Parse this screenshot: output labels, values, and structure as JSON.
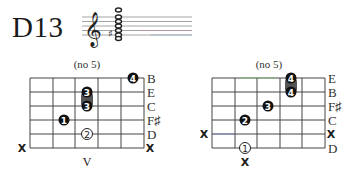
{
  "chord": {
    "name": "D13"
  },
  "staff": {
    "clef": "treble-clef",
    "accidental": "sharp",
    "notes_count": 6,
    "colors": {
      "lines": "#9a9a9a",
      "note": "#222222"
    }
  },
  "diagrams": [
    {
      "subtitle": "(no 5)",
      "strings_top_to_bottom": [
        "B",
        "E",
        "C",
        "F♯",
        "D",
        "X"
      ],
      "left_mutes": [
        {
          "string_index": 5,
          "label": "X"
        }
      ],
      "right_labels": [
        "B",
        "E",
        "C",
        "F♯",
        "D",
        "X"
      ],
      "fingers": [
        {
          "finger": "4",
          "string_index": 0,
          "fret": 5,
          "style": "filled"
        },
        {
          "finger": "3",
          "string_index": 1,
          "fret": 3,
          "style": "filled"
        },
        {
          "finger": "3",
          "string_index": 2,
          "fret": 3,
          "style": "filled"
        },
        {
          "finger": "1",
          "string_index": 3,
          "fret": 2,
          "style": "filled"
        },
        {
          "finger": "2",
          "string_index": 4,
          "fret": 3,
          "style": "open"
        }
      ],
      "barre": {
        "fret": 3,
        "from_string": 1,
        "to_string": 2
      },
      "below_label": "V",
      "below_label_fret": 3
    },
    {
      "subtitle": "(no 5)",
      "strings_top_to_bottom": [
        "E",
        "B",
        "F♯",
        "C",
        "X",
        "D"
      ],
      "left_mutes": [
        {
          "string_index": 4,
          "label": "X"
        }
      ],
      "right_labels": [
        "E",
        "B",
        "F♯",
        "C",
        "X",
        "D"
      ],
      "fingers": [
        {
          "finger": "4",
          "string_index": 0,
          "fret": 4,
          "style": "filled"
        },
        {
          "finger": "4",
          "string_index": 1,
          "fret": 4,
          "style": "filled"
        },
        {
          "finger": "3",
          "string_index": 2,
          "fret": 3,
          "style": "filled"
        },
        {
          "finger": "2",
          "string_index": 3,
          "fret": 2,
          "style": "filled"
        },
        {
          "finger": "1",
          "string_index": 5,
          "fret": 2,
          "style": "open"
        }
      ],
      "barre": {
        "fret": 4,
        "from_string": 0,
        "to_string": 1
      },
      "below_label": "X",
      "below_label_fret": 2
    }
  ],
  "labels": {
    "title": "D13",
    "d1_sub": "(no 5)",
    "d2_sub": "(no 5)",
    "d1_right": [
      "B",
      "E",
      "C",
      "F♯",
      "D",
      "X"
    ],
    "d2_right": [
      "E",
      "B",
      "F♯",
      "C",
      "X",
      "D"
    ],
    "d1_left_x": "X",
    "d2_left_x": "X",
    "d1_below": "V",
    "d2_below": "X",
    "d1_fingers": [
      "4",
      "3",
      "3",
      "1",
      "2"
    ],
    "d2_fingers": [
      "4",
      "4",
      "3",
      "2",
      "1"
    ]
  }
}
